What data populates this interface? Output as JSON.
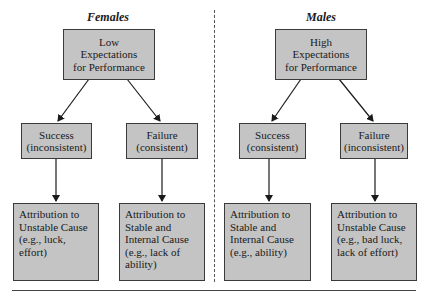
{
  "diagram": {
    "panels": [
      {
        "title": "Females",
        "expectation": [
          "Low",
          "Expectations",
          "for Performance"
        ],
        "outcomes": [
          {
            "label": [
              "Success",
              "(inconsistent)"
            ],
            "attribution": [
              "Attribution to",
              "Unstable Cause",
              "(e.g., luck,",
              "effort)"
            ]
          },
          {
            "label": [
              "Failure",
              "(consistent)"
            ],
            "attribution": [
              "Attribution to",
              "Stable and",
              "Internal Cause",
              "(e.g., lack of",
              "ability)"
            ]
          }
        ]
      },
      {
        "title": "Males",
        "expectation": [
          "High",
          "Expectations",
          "for Performance"
        ],
        "outcomes": [
          {
            "label": [
              "Success",
              "(consistent)"
            ],
            "attribution": [
              "Attribution to",
              "Stable and",
              "Internal Cause",
              "(e.g., ability)"
            ]
          },
          {
            "label": [
              "Failure",
              "(inconsistent)"
            ],
            "attribution": [
              "Attribution to",
              "Unstable Cause",
              "(e.g., bad luck,",
              "lack of effort)"
            ]
          }
        ]
      }
    ],
    "colors": {
      "box_fill": "#c4c4c4",
      "box_border": "#3a3a3a",
      "arrow": "#1a1a1a",
      "divider": "#555555"
    }
  }
}
